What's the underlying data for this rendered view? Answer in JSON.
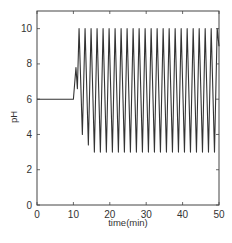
{
  "chart_data": {
    "type": "line",
    "title": "",
    "xlabel": "time(min)",
    "ylabel": "pH",
    "xlim": [
      0,
      50
    ],
    "ylim": [
      0,
      11
    ],
    "xticks": [
      0,
      10,
      20,
      30,
      40,
      50
    ],
    "yticks": [
      0,
      2,
      4,
      6,
      8,
      10
    ],
    "grid": false,
    "legend": null,
    "series": [
      {
        "name": "pH",
        "description": "Constant pH 6 from 0 to ~10 min, small rise to ~7.8 near 10.7 min, then sustained oscillations between ~3 and ~10 with period ~1.65 min until 50 min",
        "baseline": {
          "x": [
            0,
            10
          ],
          "value": 6.0
        },
        "onset": {
          "x": [
            10.0,
            10.7,
            11.1
          ],
          "y": [
            6.0,
            7.8,
            6.6
          ]
        },
        "oscillation": {
          "start_min": 11.1,
          "end_min": 50,
          "period_min": 1.65,
          "max": 10.0,
          "min": 3.0,
          "first_minima": [
            4.0,
            3.4
          ],
          "num_peaks": 24
        }
      }
    ]
  },
  "labels": {
    "xlabel": "time(min)",
    "ylabel": "pH",
    "xtick_labels": [
      "0",
      "10",
      "20",
      "30",
      "40",
      "50"
    ],
    "ytick_labels": [
      "0",
      "2",
      "4",
      "6",
      "8",
      "10"
    ]
  }
}
